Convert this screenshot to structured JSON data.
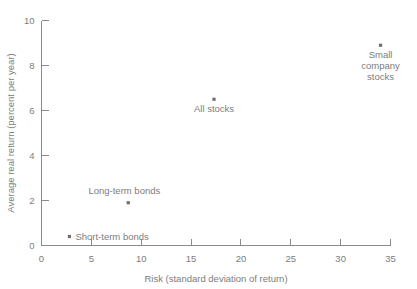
{
  "chart_data": {
    "type": "scatter",
    "title": "",
    "subtitle": "",
    "xlabel": "Risk (standard deviation of return)",
    "ylabel": "Average real return (percent per year)",
    "xlim": [
      0,
      35
    ],
    "ylim": [
      0,
      10
    ],
    "xticks": [
      0,
      5,
      10,
      15,
      20,
      25,
      30,
      35
    ],
    "yticks": [
      0,
      2,
      4,
      6,
      8,
      10
    ],
    "xtick_labels": [
      "0",
      "5",
      "10",
      "15",
      "20",
      "25",
      "30",
      "35"
    ],
    "ytick_labels": [
      "0",
      "2",
      "4",
      "6",
      "8",
      "10"
    ],
    "grid": false,
    "legend": false,
    "points": [
      {
        "label": "Short-term bonds",
        "x": 2.8,
        "y": 0.4,
        "label_lines": [
          "Short-term bonds"
        ],
        "label_position": "right"
      },
      {
        "label": "Long-term bonds",
        "x": 8.7,
        "y": 1.9,
        "label_lines": [
          "Long-term bonds"
        ],
        "label_position": "above-left"
      },
      {
        "label": "All stocks",
        "x": 17.3,
        "y": 6.5,
        "label_lines": [
          "All stocks"
        ],
        "label_position": "below"
      },
      {
        "label": "Small company stocks",
        "x": 34.0,
        "y": 8.9,
        "label_lines": [
          "Small",
          "company",
          "stocks"
        ],
        "label_position": "below"
      }
    ]
  },
  "colors": {
    "axis": "#8a8a8a",
    "text": "#7d7d7d",
    "point": "#6f6f6f",
    "background": "#ffffff"
  }
}
